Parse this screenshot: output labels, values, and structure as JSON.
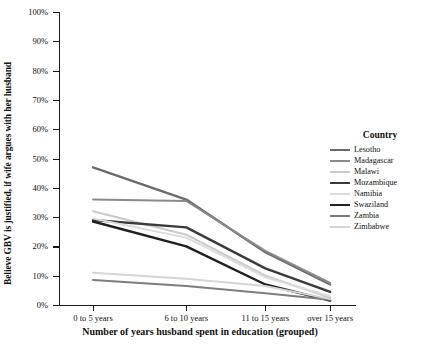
{
  "chart_data": {
    "type": "line",
    "title": "",
    "xlabel": "Number of years husband spent in education (grouped)",
    "ylabel": "Believe GBV is justified, if wife argues with her husband",
    "categories": [
      "0 to 5 years",
      "6 to 10 years",
      "11 to 15 years",
      "over 15 years"
    ],
    "ylim": [
      0,
      100
    ],
    "ytick_labels": [
      "0%",
      "10%",
      "20%",
      "30%",
      "40%",
      "50%",
      "60%",
      "70%",
      "80%",
      "90%",
      "100%"
    ],
    "ytick_values": [
      0,
      10,
      20,
      30,
      40,
      50,
      60,
      70,
      80,
      90,
      100
    ],
    "grid": false,
    "legend_position": "right",
    "legend_title": "Country",
    "series": [
      {
        "name": "Lesotho",
        "values": [
          47.0,
          36.0,
          18.0,
          7.0
        ],
        "color": "#6b6b6b",
        "width": 2.4
      },
      {
        "name": "Madagascar",
        "values": [
          36.0,
          35.5,
          18.5,
          7.5
        ],
        "color": "#8a8a8a",
        "width": 2.0
      },
      {
        "name": "Malawi",
        "values": [
          32.0,
          24.0,
          10.0,
          2.5
        ],
        "color": "#c9c9c9",
        "width": 2.0
      },
      {
        "name": "Mozambique",
        "values": [
          29.0,
          26.5,
          12.5,
          4.5
        ],
        "color": "#3a3a3a",
        "width": 2.4
      },
      {
        "name": "Namibia",
        "values": [
          29.5,
          23.0,
          9.5,
          3.0
        ],
        "color": "#dcdcdc",
        "width": 2.0
      },
      {
        "name": "Swaziland",
        "values": [
          28.5,
          20.0,
          7.0,
          1.5
        ],
        "color": "#1f1f1f",
        "width": 2.4
      },
      {
        "name": "Zambia",
        "values": [
          8.5,
          6.5,
          4.0,
          1.8
        ],
        "color": "#7d7d7d",
        "width": 2.0
      },
      {
        "name": "Zimbabwe",
        "values": [
          11.0,
          9.0,
          6.5,
          2.0
        ],
        "color": "#d5d5d5",
        "width": 2.0
      }
    ]
  }
}
